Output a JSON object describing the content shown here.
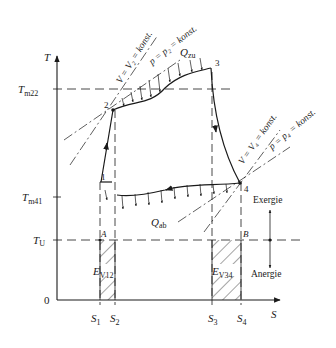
{
  "diagram": {
    "type": "T-s diagram (thermodynamic cycle with exergy/anergy)",
    "axes": {
      "y_label": "T",
      "x_label": "S",
      "origin_label": "0"
    },
    "y_ticks": [
      {
        "label": "T",
        "sub": "m22",
        "y": 89
      },
      {
        "label": "T",
        "sub": "m41",
        "y": 197
      },
      {
        "label": "T",
        "sub": "U",
        "y": 240
      }
    ],
    "x_ticks": [
      {
        "label": "S",
        "sub": "1",
        "x": 100
      },
      {
        "label": "S",
        "sub": "2",
        "x": 115
      },
      {
        "label": "S",
        "sub": "3",
        "x": 212
      },
      {
        "label": "S",
        "sub": "4",
        "x": 241
      }
    ],
    "points": [
      {
        "id": "1",
        "x": 100,
        "y": 182
      },
      {
        "id": "2",
        "x": 113,
        "y": 110
      },
      {
        "id": "3",
        "x": 211,
        "y": 68
      },
      {
        "id": "4",
        "x": 240,
        "y": 183
      },
      {
        "id": "A",
        "x": 100,
        "y": 240
      },
      {
        "id": "B",
        "x": 241,
        "y": 240
      }
    ],
    "annotations": {
      "isochore_2": "V = V₂ = konst.",
      "isobar_2": "p = p₂ = konst.",
      "isochore_4": "V = V₄ = konst.",
      "isobar_4": "p = p₄ = konst.",
      "heat_in": "Q",
      "heat_in_sub": "zu",
      "heat_out": "Q",
      "heat_out_sub": "ab",
      "exergy_loss_12": "E",
      "exergy_loss_12_sub": "V12",
      "exergy_loss_34": "E",
      "exergy_loss_34_sub": "V34",
      "exergie": "Exergie",
      "anergie": "Anergie",
      "point_A": "A",
      "point_B": "B"
    },
    "colors": {
      "ink": "#1a1a1a",
      "background": "#ffffff"
    }
  }
}
